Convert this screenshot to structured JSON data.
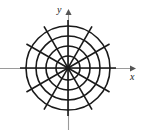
{
  "figure": {
    "kind": "polar-grid-diagram",
    "caption": "",
    "axes": {
      "x_label": "x",
      "y_label": "y",
      "x_axis_name": "x-axis",
      "y_axis_name": "y-axis",
      "arrow_x_name": "x-axis-arrowhead",
      "arrow_y_name": "y-axis-arrowhead"
    }
  },
  "chart_data": {
    "type": "line",
    "title": "",
    "subtitle": "",
    "xlabel": "x",
    "ylabel": "y",
    "xlim": [
      -2.9,
      2.9
    ],
    "ylim": [
      -2.7,
      2.7
    ],
    "grid": false,
    "legend": "none",
    "coordinate_system": "polar",
    "annotations": [
      "x",
      "y"
    ],
    "center": {
      "x": 68,
      "y": 68
    },
    "circles": {
      "count": 4,
      "radii_px": [
        12,
        22,
        32,
        42
      ],
      "radii_units": [
        1,
        2,
        3,
        4
      ],
      "stroke": "#1a1a1a",
      "stroke_width_px": 1.6,
      "fill": "none"
    },
    "spokes": {
      "count": 12,
      "angle_step_deg": 30,
      "angles_deg": [
        0,
        30,
        60,
        90,
        120,
        150,
        180,
        210,
        240,
        270,
        300,
        330
      ],
      "inner_radius_px": 0,
      "outer_radius_px": 48,
      "stroke": "#1a1a1a",
      "stroke_width_px": 1.6
    },
    "axis_lines": {
      "stroke": "#9a9a9a",
      "stroke_width_px": 1.1,
      "x_extent_px": [
        0,
        132
      ],
      "y_extent_px": [
        13,
        130
      ]
    }
  },
  "colors": {
    "background": "#ffffff",
    "ink": "#1a1a1a",
    "axis_gray": "#9a9a9a"
  }
}
